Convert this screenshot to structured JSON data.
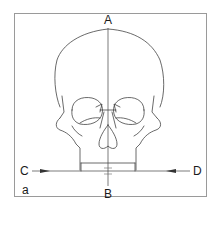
{
  "figure": {
    "panel_label": "a",
    "landmarks": {
      "top": "A",
      "bottom": "B",
      "left": "C",
      "right": "D"
    },
    "lines": [
      {
        "name": "vertical-midline",
        "from": "A",
        "to": "B"
      },
      {
        "name": "horizontal-reference-line",
        "from": "C",
        "to": "D"
      }
    ]
  }
}
